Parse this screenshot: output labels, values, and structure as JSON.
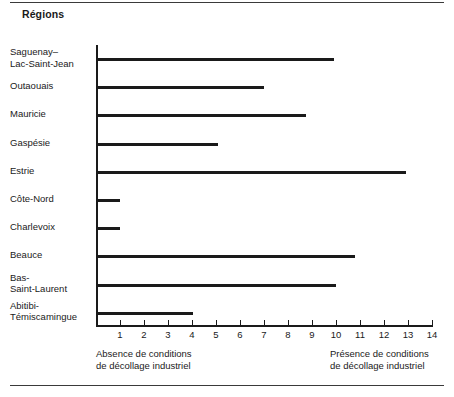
{
  "figure": {
    "title": "Régions",
    "caption_left": "Absence de conditions\nde décollage industriel",
    "caption_right": "Présence de conditions\nde décollage industriel"
  },
  "chart_data": {
    "type": "bar",
    "orientation": "horizontal",
    "title": "Régions",
    "xlabel": "",
    "ylabel": "Régions",
    "xlim": [
      0,
      14
    ],
    "grid": false,
    "legend": null,
    "xticks": [
      1,
      2,
      3,
      4,
      5,
      6,
      7,
      8,
      9,
      10,
      11,
      12,
      13,
      14
    ],
    "xtick_labels": [
      "1",
      "2",
      "3",
      "4",
      "5",
      "6",
      "7",
      "8",
      "9",
      "10",
      "11",
      "12",
      "13",
      "14"
    ],
    "annotations": [
      "Absence de conditions de décollage industriel",
      "Présence de conditions de décollage industriel"
    ],
    "categories": [
      "Saguenay–\nLac-Saint-Jean",
      "Outaouais",
      "Mauricie",
      "Gaspésie",
      "Estrie",
      "Côte-Nord",
      "Charlevoix",
      "Beauce",
      "Bas-\nSaint-Laurent",
      "Abitibi-\nTémiscamingue"
    ],
    "values": [
      9.9,
      7.0,
      8.75,
      5.1,
      12.9,
      1.0,
      1.0,
      10.8,
      10.0,
      4.05
    ],
    "bar_color": "#1a1a1a"
  }
}
